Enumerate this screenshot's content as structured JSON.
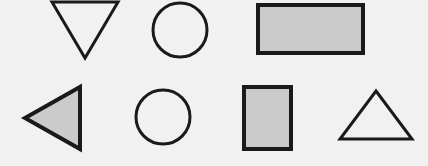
{
  "scene": {
    "title": "Geometric shape array",
    "width": 428,
    "height": 166,
    "background_color": "#f1f1f1",
    "outline_color": "#1a1a1a",
    "fill_gray": "#cbcbcb",
    "fill_none": "none",
    "rows": 2,
    "columns": 4
  },
  "shapes": [
    {
      "id": "shape-1",
      "name": "triangle-down",
      "label": "Downward triangle",
      "row": 1,
      "column": 1,
      "fill": "none",
      "filled": "false",
      "stroke_width": 3,
      "points": "52,2 118,2 85,58",
      "bbox": {
        "x": 52,
        "y": 2,
        "width": 66,
        "height": 56
      }
    },
    {
      "id": "shape-2",
      "name": "circle-outline-top",
      "label": "Circle",
      "row": 1,
      "column": 2,
      "fill": "none",
      "filled": "false",
      "stroke_width": 3,
      "cx": 180,
      "cy": 30,
      "r": 27,
      "bbox": {
        "x": 153,
        "y": 3,
        "width": 54,
        "height": 54
      }
    },
    {
      "id": "shape-3",
      "name": "rectangle-wide-filled",
      "label": "Wide rectangle",
      "row": 1,
      "column": 3,
      "fill": "#cbcbcb",
      "filled": "true",
      "stroke_width": 4,
      "x": 258,
      "y": 5,
      "width": 105,
      "height": 48,
      "bbox": {
        "x": 258,
        "y": 5,
        "width": 105,
        "height": 48
      }
    },
    {
      "id": "shape-4",
      "name": "triangle-left-filled",
      "label": "Left-pointing triangle",
      "row": 2,
      "column": 1,
      "fill": "#cbcbcb",
      "filled": "true",
      "stroke_width": 4,
      "points": "80,87 80,149 25,118",
      "bbox": {
        "x": 25,
        "y": 87,
        "width": 55,
        "height": 62
      }
    },
    {
      "id": "shape-5",
      "name": "circle-outline-bottom",
      "label": "Circle",
      "row": 2,
      "column": 2,
      "fill": "none",
      "filled": "false",
      "stroke_width": 3,
      "cx": 163,
      "cy": 117,
      "r": 27,
      "bbox": {
        "x": 136,
        "y": 90,
        "width": 54,
        "height": 54
      }
    },
    {
      "id": "shape-6",
      "name": "rectangle-tall-filled",
      "label": "Tall rectangle",
      "row": 2,
      "column": 3,
      "fill": "#cbcbcb",
      "filled": "true",
      "stroke_width": 4,
      "x": 244,
      "y": 87,
      "width": 47,
      "height": 62,
      "bbox": {
        "x": 244,
        "y": 87,
        "width": 47,
        "height": 62
      }
    },
    {
      "id": "shape-7",
      "name": "triangle-up",
      "label": "Upward triangle",
      "row": 2,
      "column": 4,
      "fill": "none",
      "filled": "false",
      "stroke_width": 3,
      "points": "376,91 412,139 340,139",
      "bbox": {
        "x": 340,
        "y": 91,
        "width": 72,
        "height": 48
      }
    }
  ]
}
